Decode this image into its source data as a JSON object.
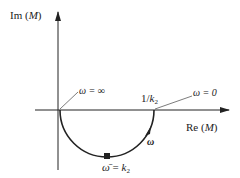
{
  "diagram": {
    "axes": {
      "y_label_prefix": "Im (",
      "y_label_var": "M",
      "y_label_suffix": ")",
      "x_label_prefix": "Re (",
      "x_label_var": "M",
      "x_label_suffix": ")"
    },
    "annotations": {
      "omega_inf": "ω = ∞",
      "omega_zero": "ω = 0",
      "intercept_num": "1/",
      "intercept_var": "k",
      "intercept_sub": "2",
      "direction_label": "ω",
      "bottom_lhs": "ω̄",
      "bottom_eq": " = ",
      "bottom_var": "k",
      "bottom_sub": "2"
    },
    "colors": {
      "line": "#222222",
      "background": "#ffffff"
    }
  }
}
